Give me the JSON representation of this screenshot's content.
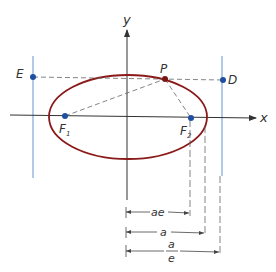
{
  "diagram": {
    "axes": {
      "x_label": "x",
      "y_label": "y"
    },
    "points": {
      "P": "P",
      "D": "D",
      "E": "E",
      "F1": "F",
      "F1_sub": "1",
      "F2": "F",
      "F2_sub": "2"
    },
    "dimensions": {
      "ae": "ae",
      "a": "a",
      "a_over_e_num": "a",
      "a_over_e_den": "e"
    },
    "colors": {
      "ellipse": "#8b1a1a",
      "directrix": "#7ea7d8",
      "point": "#1f4fa0",
      "axis": "#333333",
      "dash": "#666666"
    }
  }
}
